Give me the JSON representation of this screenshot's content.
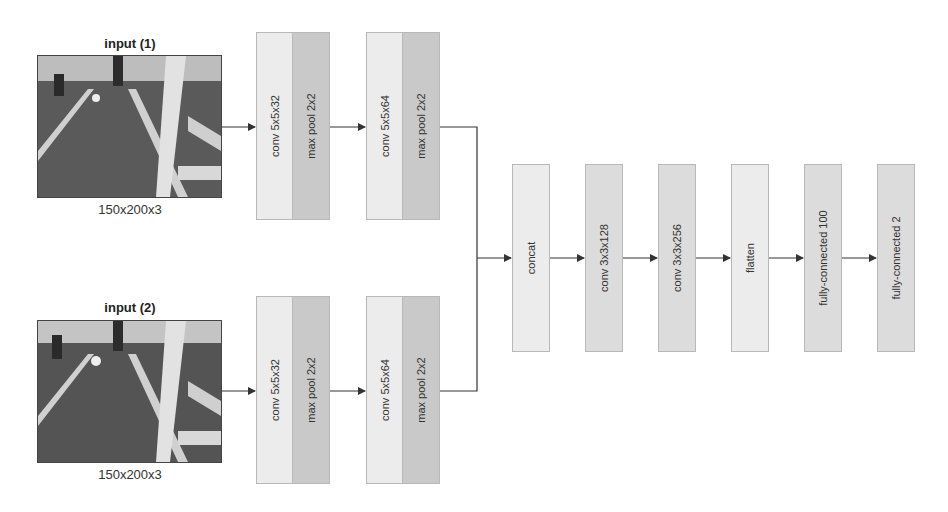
{
  "diagram": {
    "inputs": [
      {
        "title": "input (1)",
        "dims": "150x200x3",
        "image": "robot-soccer-field-camera-frame"
      },
      {
        "title": "input (2)",
        "dims": "150x200x3",
        "image": "robot-soccer-field-camera-frame"
      }
    ],
    "branch_layers": [
      {
        "conv": "conv 5x5x32",
        "pool": "max pool 2x2"
      },
      {
        "conv": "conv 5x5x64",
        "pool": "max pool 2x2"
      }
    ],
    "merged_layers": [
      {
        "label": "concat"
      },
      {
        "label": "conv 3x3x128"
      },
      {
        "label": "conv 3x3x256"
      },
      {
        "label": "flatten"
      },
      {
        "label": "fully-connected 100"
      },
      {
        "label": "fully-connected 2"
      }
    ],
    "colors": {
      "conv_box": "#ececec",
      "pool_box": "#c9c9c9",
      "merged_box": "#dcdcdc",
      "line": "#333333"
    }
  }
}
